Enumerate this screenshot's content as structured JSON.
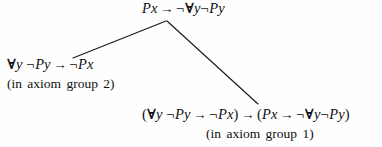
{
  "figure": {
    "type": "proof-tree",
    "background_color": "#fefefe",
    "text_color": "#111111",
    "line_color": "#1a1a1a"
  },
  "nodes": {
    "conclusion": {
      "formula": "Px → ¬∀y¬Py",
      "parts": {
        "p1": "Px",
        "arrow1": "→",
        "neg1": "¬",
        "forall": "∀",
        "var_y": "y",
        "neg2": "¬",
        "p2": "Py"
      }
    },
    "premise_left": {
      "formula": "∀y ¬Py → ¬Px",
      "annotation": "(in axiom group 2)",
      "parts": {
        "forall": "∀",
        "var_y": "y",
        "neg1": "¬",
        "p1": "Py",
        "arrow": "→",
        "neg2": "¬",
        "p2": "Px"
      }
    },
    "premise_right": {
      "formula": "(∀y ¬Py → ¬Px) → (Px → ¬∀y¬Py)",
      "annotation": "(in axiom group 1)",
      "parts": {
        "open1": "(",
        "forall1": "∀",
        "var_y1": "y",
        "neg1": "¬",
        "p1": "Py",
        "arrow1": "→",
        "neg2": "¬",
        "p2": "Px",
        "close1": ")",
        "arrow_main": "→",
        "open2": "(",
        "p3": "Px",
        "arrow2": "→",
        "neg3": "¬",
        "forall2": "∀",
        "var_y2": "y",
        "neg4": "¬",
        "p4": "Py",
        "close2": ")"
      }
    }
  },
  "connectors": [
    {
      "name": "edge-to-left-premise",
      "from_x": 166,
      "from_y": 21,
      "to_x": 73,
      "to_y": 58
    },
    {
      "name": "edge-to-right-premise",
      "from_x": 167,
      "from_y": 21,
      "to_x": 258,
      "to_y": 104
    }
  ]
}
